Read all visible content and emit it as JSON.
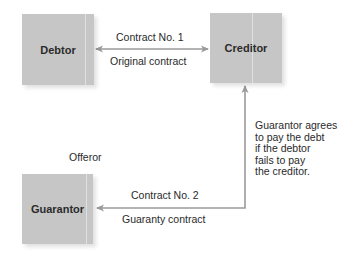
{
  "diagram": {
    "title": "",
    "nodes": {
      "debtor": {
        "label": "Debtor"
      },
      "creditor": {
        "label": "Creditor"
      },
      "guarantor": {
        "label": "Guarantor"
      }
    },
    "edges": {
      "contract1": {
        "from": "debtor",
        "to": "creditor",
        "direction": "both",
        "label_top": "Contract No. 1",
        "label_bottom": "Original contract"
      },
      "contract2": {
        "from": "creditor",
        "to": "guarantor",
        "direction": "both",
        "label_top": "Contract No. 2",
        "label_bottom": "Guaranty contract"
      }
    },
    "annotations": {
      "offeror": "Offeror",
      "guarantee_note": [
        "Guarantor agrees",
        "to pay the debt",
        "if the debtor",
        "fails to pay",
        "the creditor."
      ]
    },
    "colors": {
      "box_fill": "#c6c6c6",
      "arrow": "#9a9a9a",
      "text": "#2a2a2a"
    }
  }
}
